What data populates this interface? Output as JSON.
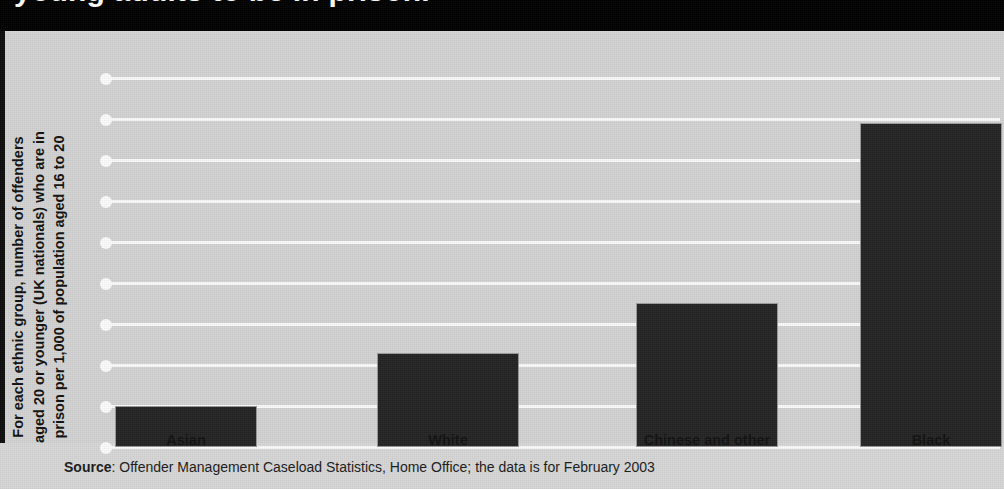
{
  "title": {
    "text": "young adults to be in prison.",
    "note": "clipped headline, white bold on black band"
  },
  "chart_data": {
    "type": "bar",
    "title": "young adults to be in prison.",
    "categories": [
      "Asian",
      "White",
      "Chinese and other",
      "Black"
    ],
    "values": [
      1.0,
      2.3,
      3.5,
      7.9
    ],
    "series": [
      {
        "name": "Offenders per 1,000 population aged 16 to 20",
        "values": [
          1.0,
          2.3,
          3.5,
          7.9
        ]
      }
    ],
    "xlabel": "",
    "ylabel": "For each ethnic group, number of offenders aged 20 or younger (UK nationals) who are in prison per 1,000 of population aged 16 to 20",
    "ylim": [
      0,
      10
    ],
    "ytick_count": 10,
    "ytick_labels": [],
    "grid": true,
    "legend": false,
    "bar_color": "#232323",
    "plot_background": "#d4d4d4",
    "gridline_color": "#fbfbfb"
  },
  "axis": {
    "y_label_lines": "For each ethnic group, number of offenders\naged 20 or younger (UK nationals) who are in\nprison per 1,000 of population aged 16 to 20"
  },
  "source": {
    "label": "Source",
    "text": ": Offender Management Caseload Statistics, Home Office; the data is for February 2003"
  },
  "colors": {
    "title_band": "#000000",
    "title_text": "#ffffff",
    "bar": "#232323",
    "plot_bg": "#d4d4d4",
    "page_bg": "#d8d8d8",
    "gridline": "#fbfbfb"
  }
}
